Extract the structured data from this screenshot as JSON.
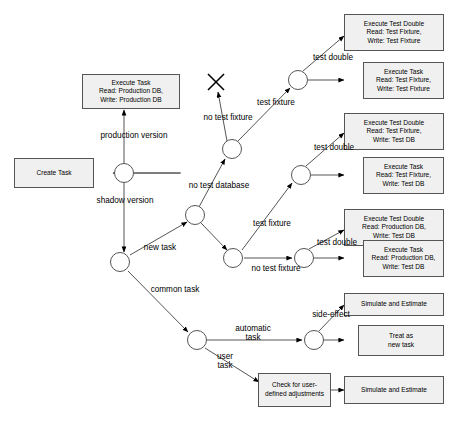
{
  "diagram": {
    "colors": {
      "stroke": "#555555",
      "box_fill": "#f0f0f0",
      "node_fill": "#ffffff",
      "text": "#000000"
    },
    "start": {
      "label": "Create Task"
    },
    "boxes": [
      {
        "id": "exec-task-prod",
        "label": "Execute Task\nRead: Production DB,\nWrite: Production DB"
      },
      {
        "id": "exec-td-fix-fix",
        "label": "Execute Test Double\nRead: Test Fixture,\nWrite: Test Fixture"
      },
      {
        "id": "exec-task-fix-fix",
        "label": "Execute Task\nRead: Test Fixture,\nWrite: Test Fixture"
      },
      {
        "id": "exec-td-fix-testdb",
        "label": "Execute Test Double\nRead: Test Fixture,\nWrite: Test DB"
      },
      {
        "id": "exec-task-fix-testdb",
        "label": "Execute Task\nRead: Test Fixture,\nWrite: Test DB"
      },
      {
        "id": "exec-td-prod-testdb",
        "label": "Execute Test Double\nRead: Production DB,\nWrite: Test DB"
      },
      {
        "id": "exec-task-prod-testdb",
        "label": "Execute Task\nRead: Production DB,\nWrite: Test DB"
      },
      {
        "id": "simulate-estimate-1",
        "label": "Simulate and Estimate"
      },
      {
        "id": "treat-as-new-task",
        "label": "Treat as\nnew task"
      },
      {
        "id": "check-user-adjust",
        "label": "Check for user-\ndefined adjustments"
      },
      {
        "id": "simulate-estimate-2",
        "label": "Simulate and Estimate"
      }
    ],
    "edge_labels": [
      {
        "id": "production-version",
        "text": "production version"
      },
      {
        "id": "shadow-version",
        "text": "shadow version"
      },
      {
        "id": "new-task",
        "text": "new task"
      },
      {
        "id": "common-task",
        "text": "common task"
      },
      {
        "id": "no-test-database",
        "text": "no test database"
      },
      {
        "id": "no-test-fixture-top",
        "text": "no test fixture"
      },
      {
        "id": "test-fixture-top",
        "text": "test fixture"
      },
      {
        "id": "test-double-1",
        "text": "test double"
      },
      {
        "id": "test-fixture-mid",
        "text": "test fixture"
      },
      {
        "id": "test-double-2",
        "text": "test double"
      },
      {
        "id": "no-test-fixture-mid",
        "text": "no test fixture"
      },
      {
        "id": "test-double-3",
        "text": "test double"
      },
      {
        "id": "automatic-task",
        "text": "automatic\ntask"
      },
      {
        "id": "user-task",
        "text": "user\ntask"
      },
      {
        "id": "side-effect",
        "text": "side-effect"
      }
    ],
    "junctions": [
      {
        "id": "j-version-split"
      },
      {
        "id": "j-task-type-split"
      },
      {
        "id": "j-test-db-split"
      },
      {
        "id": "j-test-fixture-split"
      },
      {
        "id": "j-no-test-db-fixture"
      },
      {
        "id": "j-double-fix-fix"
      },
      {
        "id": "j-double-fix-testdb"
      },
      {
        "id": "j-double-prod-testdb"
      },
      {
        "id": "j-task-kind"
      },
      {
        "id": "j-side-effect"
      }
    ],
    "terminator": {
      "id": "dead-end-x",
      "label": "X"
    }
  }
}
